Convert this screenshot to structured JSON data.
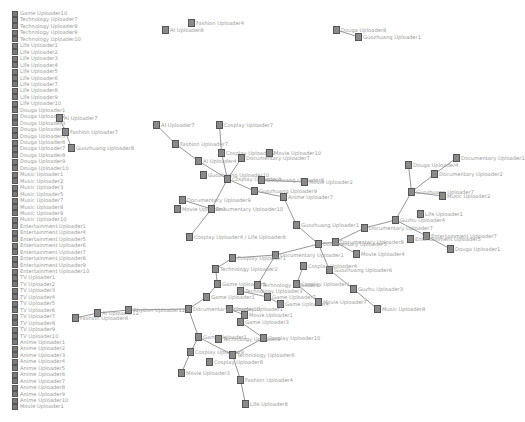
{
  "legend": {
    "items": [
      {
        "label": "Game Uploader10"
      },
      {
        "label": "Technology Uploader7"
      },
      {
        "label": "Technology Uploader8"
      },
      {
        "label": "Technology Uploader9"
      },
      {
        "label": "Technology Uploader10"
      },
      {
        "label": "Life Uploader1"
      },
      {
        "label": "Life Uploader2"
      },
      {
        "label": "Life Uploader3"
      },
      {
        "label": "Life Uploader4"
      },
      {
        "label": "Life Uploader5"
      },
      {
        "label": "Life Uploader6"
      },
      {
        "label": "Life Uploader7"
      },
      {
        "label": "Life Uploader8"
      },
      {
        "label": "Life Uploader9"
      },
      {
        "label": "Life Uploader10"
      },
      {
        "label": "Douga Uploader1"
      },
      {
        "label": "Douga Uploader2"
      },
      {
        "label": "Douga Uploader3"
      },
      {
        "label": "Douga Uploader4"
      },
      {
        "label": "Douga Uploader5"
      },
      {
        "label": "Douga Uploader6"
      },
      {
        "label": "Douga Uploader7"
      },
      {
        "label": "Douga Uploader8"
      },
      {
        "label": "Douga Uploader9"
      },
      {
        "label": "Douga Uploader10"
      },
      {
        "label": "Music Uploader1"
      },
      {
        "label": "Music Uploader2"
      },
      {
        "label": "Music Uploader3"
      },
      {
        "label": "Music Uploader5"
      },
      {
        "label": "Music Uploader7"
      },
      {
        "label": "Music Uploader8"
      },
      {
        "label": "Music Uploader9"
      },
      {
        "label": "Music Uploader10"
      },
      {
        "label": "Entertainment Uploader1"
      },
      {
        "label": "Entertainment Uploader4"
      },
      {
        "label": "Entertainment Uploader5"
      },
      {
        "label": "Entertainment Uploader6"
      },
      {
        "label": "Entertainment Uploader7"
      },
      {
        "label": "Entertainment Uploader8"
      },
      {
        "label": "Entertainment Uploader9"
      },
      {
        "label": "Entertainment Uploader10"
      },
      {
        "label": "TV Uploader1"
      },
      {
        "label": "TV Uploader2"
      },
      {
        "label": "TV Uploader3"
      },
      {
        "label": "TV Uploader4"
      },
      {
        "label": "TV Uploader5"
      },
      {
        "label": "TV Uploader6"
      },
      {
        "label": "TV Uploader7"
      },
      {
        "label": "TV Uploader8"
      },
      {
        "label": "TV Uploader9"
      },
      {
        "label": "TV Uploader10"
      },
      {
        "label": "Anime Uploader1"
      },
      {
        "label": "Anime Uploader2"
      },
      {
        "label": "Anime Uploader3"
      },
      {
        "label": "Anime Uploader4"
      },
      {
        "label": "Anime Uploader5"
      },
      {
        "label": "Anime Uploader6"
      },
      {
        "label": "Anime Uploader7"
      },
      {
        "label": "Anime Uploader8"
      },
      {
        "label": "Anime Uploader9"
      },
      {
        "label": "Anime Uploader10"
      },
      {
        "label": "Movie Uploader1"
      }
    ]
  },
  "graph": {
    "nodes": [
      {
        "id": "n1",
        "label": "AI Uploader7",
        "x": 56,
        "y": 114
      },
      {
        "id": "n2",
        "label": "Fashion Uploader7",
        "x": 62,
        "y": 128
      },
      {
        "id": "n3",
        "label": "Guozhuang Uploader8",
        "x": 68,
        "y": 144
      },
      {
        "id": "n4",
        "label": "Fashion Uploader4",
        "x": 188,
        "y": 19
      },
      {
        "id": "n5",
        "label": "AI Uploader8",
        "x": 162,
        "y": 26
      },
      {
        "id": "n6",
        "label": "Douga Uploader8",
        "x": 333,
        "y": 26
      },
      {
        "id": "n7",
        "label": "Guozhuang Uploader1",
        "x": 355,
        "y": 33
      },
      {
        "id": "n8",
        "label": "AI Uploader7",
        "x": 153,
        "y": 121
      },
      {
        "id": "n9",
        "label": "Fashion Uploader7",
        "x": 172,
        "y": 140
      },
      {
        "id": "n10",
        "label": "AI Uploader4",
        "x": 195,
        "y": 157
      },
      {
        "id": "n11",
        "label": "Cosplay Uploader7",
        "x": 216,
        "y": 121
      },
      {
        "id": "n12",
        "label": "Cosplay Uploader2",
        "x": 218,
        "y": 149
      },
      {
        "id": "n13",
        "label": "Documentary Uploader7",
        "x": 238,
        "y": 154
      },
      {
        "id": "n14",
        "label": "Movie Uploader10",
        "x": 266,
        "y": 149
      },
      {
        "id": "n15",
        "label": "Guozhuang Uploader10",
        "x": 200,
        "y": 171
      },
      {
        "id": "n16",
        "label": "Cosplay Uploader3",
        "x": 224,
        "y": 175
      },
      {
        "id": "n17",
        "label": "Guozhuang Uploader8",
        "x": 258,
        "y": 176
      },
      {
        "id": "n18",
        "label": "Movie Uploader2",
        "x": 301,
        "y": 178
      },
      {
        "id": "n19",
        "label": "Guozhuang Uploader9",
        "x": 251,
        "y": 187
      },
      {
        "id": "n20",
        "label": "Anime Uploader7",
        "x": 280,
        "y": 193
      },
      {
        "id": "n21",
        "label": "Documentary Uploader9",
        "x": 179,
        "y": 196
      },
      {
        "id": "n22",
        "label": "Movie Uploader3",
        "x": 174,
        "y": 205
      },
      {
        "id": "n23",
        "label": "Documentary Uploader10",
        "x": 208,
        "y": 205
      },
      {
        "id": "n24",
        "label": "Guozhuang Uploader1",
        "x": 293,
        "y": 221
      },
      {
        "id": "n25",
        "label": "Cosplay Uploader4 / Life Uploader8",
        "x": 186,
        "y": 233
      },
      {
        "id": "n26",
        "label": "Douga Uploader4",
        "x": 405,
        "y": 161
      },
      {
        "id": "n27",
        "label": "Documentary Uploader1",
        "x": 453,
        "y": 154
      },
      {
        "id": "n28",
        "label": "Documentary Uploader2",
        "x": 431,
        "y": 170
      },
      {
        "id": "n29",
        "label": "Guozhuang Uploader7",
        "x": 408,
        "y": 188
      },
      {
        "id": "n30",
        "label": "Music Uploader2",
        "x": 439,
        "y": 192
      },
      {
        "id": "n31",
        "label": "Life Uploader1",
        "x": 417,
        "y": 210
      },
      {
        "id": "n32",
        "label": "Guzhu Uploader4",
        "x": 392,
        "y": 216
      },
      {
        "id": "n33",
        "label": "Documentary Uploader7",
        "x": 361,
        "y": 224
      },
      {
        "id": "n34",
        "label": "Entertainment Uploader7",
        "x": 423,
        "y": 232
      },
      {
        "id": "n35",
        "label": "Entertainment Uploader5",
        "x": 407,
        "y": 235
      },
      {
        "id": "n36",
        "label": "Douga Uploader1",
        "x": 447,
        "y": 245
      },
      {
        "id": "n37",
        "label": "Documentary Uploader8",
        "x": 332,
        "y": 238
      },
      {
        "id": "n38",
        "label": "Movie Uploader4",
        "x": 353,
        "y": 250
      },
      {
        "id": "n39",
        "label": "Documentary Uploader5",
        "x": 315,
        "y": 240
      },
      {
        "id": "n40",
        "label": "Guozhuang Uploader6",
        "x": 326,
        "y": 266
      },
      {
        "id": "n41",
        "label": "Cosplay Uploader4",
        "x": 300,
        "y": 262
      },
      {
        "id": "n42",
        "label": "Documentary Uploader1",
        "x": 272,
        "y": 251
      },
      {
        "id": "n43",
        "label": "Cosplay Uploader1",
        "x": 229,
        "y": 254
      },
      {
        "id": "n44",
        "label": "Technology Uploader2",
        "x": 212,
        "y": 265
      },
      {
        "id": "n45",
        "label": "Game Uploader3",
        "x": 214,
        "y": 280
      },
      {
        "id": "n46",
        "label": "Technology Uploader1",
        "x": 254,
        "y": 281
      },
      {
        "id": "n47",
        "label": "Cosplay Uploader1",
        "x": 293,
        "y": 280
      },
      {
        "id": "n48",
        "label": "Game Uploader1",
        "x": 203,
        "y": 293
      },
      {
        "id": "n49",
        "label": "Technology Uploader3",
        "x": 237,
        "y": 287
      },
      {
        "id": "n50",
        "label": "Game Uploader7",
        "x": 264,
        "y": 293
      },
      {
        "id": "n51",
        "label": "Game Uploader4",
        "x": 277,
        "y": 300
      },
      {
        "id": "n52",
        "label": "Movie Uploader7",
        "x": 315,
        "y": 298
      },
      {
        "id": "n53",
        "label": "Guzhu Uploader3",
        "x": 350,
        "y": 285
      },
      {
        "id": "n54",
        "label": "Music Uploader8",
        "x": 374,
        "y": 305
      },
      {
        "id": "n55",
        "label": "Cosplay Uploader1",
        "x": 226,
        "y": 305
      },
      {
        "id": "n56",
        "label": "Movie Uploader1",
        "x": 241,
        "y": 311
      },
      {
        "id": "n57",
        "label": "Game Uploader3",
        "x": 237,
        "y": 318
      },
      {
        "id": "n58",
        "label": "Documentary Uploader10",
        "x": 185,
        "y": 305
      },
      {
        "id": "n59",
        "label": "Game Uploader1",
        "x": 195,
        "y": 333
      },
      {
        "id": "n60",
        "label": "Technology Uploader9",
        "x": 215,
        "y": 335
      },
      {
        "id": "n61",
        "label": "Cosplay Uploader10",
        "x": 260,
        "y": 334
      },
      {
        "id": "n62",
        "label": "Cosplay Uploader9",
        "x": 187,
        "y": 348
      },
      {
        "id": "n63",
        "label": "Cosplay Uploader8",
        "x": 206,
        "y": 358
      },
      {
        "id": "n64",
        "label": "Technology Uploader6",
        "x": 229,
        "y": 351
      },
      {
        "id": "n65",
        "label": "Movie Uploader3",
        "x": 178,
        "y": 369
      },
      {
        "id": "n66",
        "label": "Fashion Uploader4",
        "x": 237,
        "y": 376
      },
      {
        "id": "n67",
        "label": "Life Uploader8",
        "x": 242,
        "y": 400
      },
      {
        "id": "n68",
        "label": "AI Uploader12",
        "x": 94,
        "y": 309
      },
      {
        "id": "n69",
        "label": "Fashion Uploader8",
        "x": 72,
        "y": 314
      },
      {
        "id": "n70",
        "label": "Rhythm Uploader12",
        "x": 125,
        "y": 306
      }
    ],
    "edges": [
      [
        "n1",
        "n2"
      ],
      [
        "n2",
        "n3"
      ],
      [
        "n6",
        "n7"
      ],
      [
        "n8",
        "n9"
      ],
      [
        "n9",
        "n10"
      ],
      [
        "n10",
        "n16"
      ],
      [
        "n11",
        "n12"
      ],
      [
        "n12",
        "n16"
      ],
      [
        "n13",
        "n16"
      ],
      [
        "n16",
        "n19"
      ],
      [
        "n19",
        "n20"
      ],
      [
        "n17",
        "n18"
      ],
      [
        "n20",
        "n24"
      ],
      [
        "n16",
        "n23"
      ],
      [
        "n21",
        "n23"
      ],
      [
        "n23",
        "n25"
      ],
      [
        "n24",
        "n39"
      ],
      [
        "n26",
        "n29"
      ],
      [
        "n27",
        "n28"
      ],
      [
        "n28",
        "n29"
      ],
      [
        "n29",
        "n30"
      ],
      [
        "n29",
        "n32"
      ],
      [
        "n32",
        "n33"
      ],
      [
        "n32",
        "n34"
      ],
      [
        "n34",
        "n36"
      ],
      [
        "n33",
        "n37"
      ],
      [
        "n37",
        "n38"
      ],
      [
        "n37",
        "n39"
      ],
      [
        "n39",
        "n40"
      ],
      [
        "n40",
        "n53"
      ],
      [
        "n53",
        "n54"
      ],
      [
        "n39",
        "n42"
      ],
      [
        "n42",
        "n46"
      ],
      [
        "n41",
        "n47"
      ],
      [
        "n42",
        "n43"
      ],
      [
        "n43",
        "n44"
      ],
      [
        "n44",
        "n45"
      ],
      [
        "n45",
        "n48"
      ],
      [
        "n46",
        "n50"
      ],
      [
        "n47",
        "n52"
      ],
      [
        "n48",
        "n58"
      ],
      [
        "n49",
        "n50"
      ],
      [
        "n50",
        "n51"
      ],
      [
        "n55",
        "n56"
      ],
      [
        "n56",
        "n57"
      ],
      [
        "n58",
        "n70"
      ],
      [
        "n70",
        "n68"
      ],
      [
        "n68",
        "n69"
      ],
      [
        "n58",
        "n59"
      ],
      [
        "n59",
        "n62"
      ],
      [
        "n62",
        "n65"
      ],
      [
        "n59",
        "n64"
      ],
      [
        "n61",
        "n64"
      ],
      [
        "n64",
        "n66"
      ],
      [
        "n66",
        "n67"
      ],
      [
        "n57",
        "n61"
      ]
    ]
  }
}
